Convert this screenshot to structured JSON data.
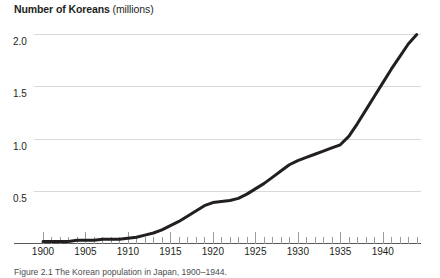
{
  "figure": {
    "title_strong": "Number of Koreans",
    "title_weak": " (millions)",
    "caption": "Figure 2.1  The Korean population in Japan, 1900–1944."
  },
  "colors": {
    "line": "#231f20",
    "grid": "#d9d9d9",
    "axis": "#58595b",
    "tick": "#9a9b9e",
    "text": "#231f20",
    "background": "#ffffff"
  },
  "chart_data": {
    "type": "line",
    "title": "Number of Koreans (millions)",
    "xlabel": "",
    "ylabel": "Number of Koreans (millions)",
    "xlim": [
      1899,
      1944.5
    ],
    "ylim": [
      0,
      2.15
    ],
    "grid": true,
    "legend": "none",
    "y_ticks": [
      "0.5",
      "1.0",
      "1.5",
      "2.0"
    ],
    "y_tick_values": [
      0.5,
      1.0,
      1.5,
      2.0
    ],
    "x_ticks": [
      "1900",
      "1905",
      "1910",
      "1915",
      "1920",
      "1925",
      "1930",
      "1935",
      "1940"
    ],
    "x_tick_values": [
      1900,
      1905,
      1910,
      1915,
      1920,
      1925,
      1930,
      1935,
      1940
    ],
    "x_minor_tick_step": 1,
    "series": [
      {
        "name": "Koreans in Japan",
        "x": [
          1900,
          1901,
          1902,
          1903,
          1904,
          1905,
          1906,
          1907,
          1908,
          1909,
          1910,
          1911,
          1912,
          1913,
          1914,
          1915,
          1916,
          1917,
          1918,
          1919,
          1920,
          1921,
          1922,
          1923,
          1924,
          1925,
          1926,
          1927,
          1928,
          1929,
          1930,
          1931,
          1932,
          1933,
          1934,
          1935,
          1936,
          1937,
          1938,
          1939,
          1940,
          1941,
          1942,
          1943,
          1944
        ],
        "values": [
          0.02,
          0.02,
          0.02,
          0.02,
          0.03,
          0.03,
          0.03,
          0.04,
          0.04,
          0.04,
          0.05,
          0.06,
          0.08,
          0.1,
          0.13,
          0.17,
          0.21,
          0.26,
          0.31,
          0.36,
          0.39,
          0.4,
          0.41,
          0.43,
          0.47,
          0.52,
          0.57,
          0.63,
          0.69,
          0.75,
          0.79,
          0.82,
          0.85,
          0.88,
          0.91,
          0.94,
          1.02,
          1.14,
          1.27,
          1.4,
          1.53,
          1.66,
          1.78,
          1.9,
          1.99
        ]
      }
    ]
  }
}
